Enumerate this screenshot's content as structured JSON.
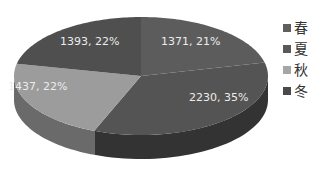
{
  "chart_data": {
    "type": "pie",
    "style": "3d",
    "title": "",
    "categories": [
      "春",
      "夏",
      "秋",
      "冬"
    ],
    "values": [
      1371,
      2230,
      1437,
      1393
    ],
    "percentages": [
      21,
      35,
      22,
      22
    ],
    "data_labels": [
      "1371, 21%",
      "2230, 35%",
      "1437, 22%",
      "1393, 22%"
    ],
    "colors": [
      "#5c5c5c",
      "#545454",
      "#9c9c9c",
      "#4f4f4f"
    ],
    "side_colors": [
      "#3a3a3a",
      "#333333",
      "#6a6a6a",
      "#5a5a5a"
    ],
    "legend_colors": [
      "#5f5f5f",
      "#595959",
      "#a6a6a6",
      "#4a4a4a"
    ],
    "legend": {
      "position": "right",
      "entries": [
        "春",
        "夏",
        "秋",
        "冬"
      ]
    }
  }
}
